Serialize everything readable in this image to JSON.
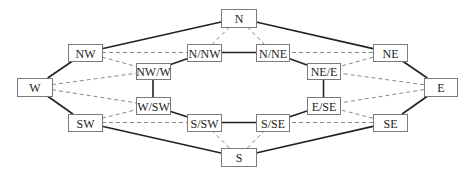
{
  "diagram": {
    "type": "graph",
    "colors": {
      "solid_edge": "#222222",
      "dashed_edge": "#888888",
      "node_border": "#7a7a7a"
    },
    "nodes": [
      {
        "id": "N",
        "label": "N",
        "x": 221,
        "y": 9,
        "w": 35,
        "h": 18
      },
      {
        "id": "NW",
        "label": "NW",
        "x": 68,
        "y": 44,
        "w": 34,
        "h": 17
      },
      {
        "id": "N/NW",
        "label": "N/NW",
        "x": 187,
        "y": 44,
        "w": 34,
        "h": 17
      },
      {
        "id": "N/NE",
        "label": "N/NE",
        "x": 256,
        "y": 44,
        "w": 33,
        "h": 17
      },
      {
        "id": "NE",
        "label": "NE",
        "x": 373,
        "y": 44,
        "w": 34,
        "h": 17
      },
      {
        "id": "NW/W",
        "label": "NW/W",
        "x": 136,
        "y": 63,
        "w": 34,
        "h": 16
      },
      {
        "id": "NE/E",
        "label": "NE/E",
        "x": 307,
        "y": 63,
        "w": 33,
        "h": 16
      },
      {
        "id": "W",
        "label": "W",
        "x": 17,
        "y": 78,
        "w": 35,
        "h": 18
      },
      {
        "id": "E",
        "label": "E",
        "x": 424,
        "y": 78,
        "w": 33,
        "h": 18
      },
      {
        "id": "W/SW",
        "label": "W/SW",
        "x": 136,
        "y": 97,
        "w": 34,
        "h": 17
      },
      {
        "id": "E/SE",
        "label": "E/SE",
        "x": 307,
        "y": 97,
        "w": 33,
        "h": 17
      },
      {
        "id": "SW",
        "label": "SW",
        "x": 68,
        "y": 114,
        "w": 34,
        "h": 17
      },
      {
        "id": "S/SW",
        "label": "S/SW",
        "x": 187,
        "y": 114,
        "w": 34,
        "h": 17
      },
      {
        "id": "S/SE",
        "label": "S/SE",
        "x": 256,
        "y": 114,
        "w": 33,
        "h": 17
      },
      {
        "id": "SE",
        "label": "SE",
        "x": 373,
        "y": 114,
        "w": 34,
        "h": 17
      },
      {
        "id": "S",
        "label": "S",
        "x": 221,
        "y": 148,
        "w": 35,
        "h": 18
      }
    ],
    "solid_edges": [
      [
        "W",
        "NW"
      ],
      [
        "NW",
        "N"
      ],
      [
        "N",
        "NE"
      ],
      [
        "NE",
        "E"
      ],
      [
        "W",
        "SW"
      ],
      [
        "SW",
        "S"
      ],
      [
        "S",
        "SE"
      ],
      [
        "SE",
        "E"
      ],
      [
        "NW/W",
        "N/NW"
      ],
      [
        "N/NW",
        "N/NE"
      ],
      [
        "N/NE",
        "NE/E"
      ],
      [
        "NE/E",
        "E/SE"
      ],
      [
        "E/SE",
        "S/SE"
      ],
      [
        "S/SE",
        "S/SW"
      ],
      [
        "S/SW",
        "W/SW"
      ],
      [
        "W/SW",
        "NW/W"
      ]
    ],
    "dashed_edges": [
      [
        "N",
        "N/NW"
      ],
      [
        "N",
        "N/NE"
      ],
      [
        "NW",
        "N/NW"
      ],
      [
        "NW",
        "NW/W"
      ],
      [
        "NE",
        "N/NE"
      ],
      [
        "NE",
        "NE/E"
      ],
      [
        "W",
        "NW/W"
      ],
      [
        "W",
        "W/SW"
      ],
      [
        "E",
        "NE/E"
      ],
      [
        "E",
        "E/SE"
      ],
      [
        "SW",
        "W/SW"
      ],
      [
        "SW",
        "S/SW"
      ],
      [
        "SE",
        "E/SE"
      ],
      [
        "SE",
        "S/SE"
      ],
      [
        "S",
        "S/SW"
      ],
      [
        "S",
        "S/SE"
      ]
    ]
  }
}
